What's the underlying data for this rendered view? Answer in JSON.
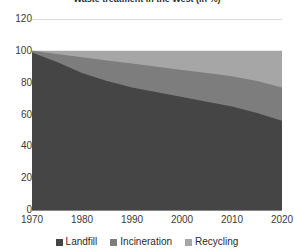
{
  "chart_data": {
    "type": "area",
    "stacked": true,
    "percent": true,
    "title": "Waste treatment in the West (in %)",
    "xlabel": "",
    "ylabel": "",
    "xlim": [
      1970,
      2020
    ],
    "ylim": [
      0,
      120
    ],
    "xticks": [
      1970,
      1980,
      1990,
      2000,
      2010,
      2020
    ],
    "yticks": [
      0,
      20,
      40,
      60,
      80,
      100,
      120
    ],
    "grid": true,
    "legend_position": "bottom",
    "x": [
      1970,
      1975,
      1980,
      1985,
      1990,
      1995,
      2000,
      2005,
      2010,
      2015,
      2020
    ],
    "series": [
      {
        "name": "Landfill",
        "color": "#454545",
        "values": [
          99,
          93,
          86,
          81,
          77,
          74,
          71,
          68,
          65,
          61,
          56
        ]
      },
      {
        "name": "Incineration",
        "color": "#7d7d7d",
        "values": [
          1,
          5,
          10,
          13,
          15,
          16,
          17,
          18,
          19,
          20,
          21
        ]
      },
      {
        "name": "Recycling",
        "color": "#a6a6a6",
        "values": [
          0,
          2,
          4,
          6,
          8,
          10,
          12,
          14,
          16,
          19,
          23
        ]
      }
    ],
    "colors": {
      "landfill": "#454545",
      "incineration": "#7d7d7d",
      "recycling": "#a6a6a6",
      "gridline": "#d9d9d9",
      "axis": "#868686",
      "text": "#3a3a3a",
      "background": "#ffffff"
    }
  },
  "axes": {
    "y_ticks": [
      {
        "label": "120",
        "value": 120
      },
      {
        "label": "100",
        "value": 100
      },
      {
        "label": "80",
        "value": 80
      },
      {
        "label": "60",
        "value": 60
      },
      {
        "label": "40",
        "value": 40
      },
      {
        "label": "20",
        "value": 20
      },
      {
        "label": "0",
        "value": 0
      }
    ],
    "x_ticks": [
      {
        "label": "1970",
        "value": 1970
      },
      {
        "label": "1980",
        "value": 1980
      },
      {
        "label": "1990",
        "value": 1990
      },
      {
        "label": "2000",
        "value": 2000
      },
      {
        "label": "2010",
        "value": 2010
      },
      {
        "label": "2020",
        "value": 2020
      }
    ]
  },
  "legend": {
    "items": [
      {
        "label": "Landfill",
        "color": "#454545"
      },
      {
        "label": "Incineration",
        "color": "#7d7d7d"
      },
      {
        "label": "Recycling",
        "color": "#a6a6a6"
      }
    ]
  },
  "title": {
    "text": "Waste treatment in the West (in %)"
  }
}
